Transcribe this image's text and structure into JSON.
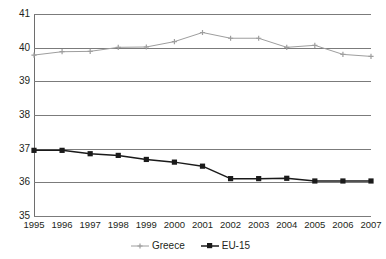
{
  "chart_data": {
    "type": "line",
    "title": "",
    "subtitle": "",
    "xlabel": "",
    "ylabel": "",
    "categories": [
      "1995",
      "1996",
      "1997",
      "1998",
      "1999",
      "2000",
      "2001",
      "2002",
      "2003",
      "2004",
      "2005",
      "2006",
      "2007"
    ],
    "x": [
      1995,
      1996,
      1997,
      1998,
      1999,
      2000,
      2001,
      2002,
      2003,
      2004,
      2005,
      2006,
      2007
    ],
    "ylim": [
      35,
      41
    ],
    "yticks": [
      41,
      40,
      39,
      38,
      37,
      36,
      35
    ],
    "ytick_labels": [
      "41",
      "40",
      "39",
      "38",
      "37",
      "36",
      "35"
    ],
    "grid": true,
    "legend_position": "bottom",
    "series": [
      {
        "name": "Greece",
        "color": "#9e9e9e",
        "marker": "small-cross",
        "values": [
          39.78,
          39.88,
          39.89,
          40.01,
          40.02,
          40.18,
          40.45,
          40.28,
          40.28,
          40.01,
          40.07,
          39.8,
          39.74
        ]
      },
      {
        "name": "EU-15",
        "color": "#1a1a1a",
        "marker": "square",
        "values": [
          36.95,
          36.95,
          36.85,
          36.8,
          36.68,
          36.6,
          36.48,
          36.11,
          36.11,
          36.12,
          36.04,
          36.04,
          36.04
        ]
      }
    ],
    "axis_color": "#6e6e6e",
    "grid_color": "#7b7b7b",
    "text_color": "#231f20",
    "background": "#ffffff"
  },
  "legend": {
    "items": [
      {
        "label": "Greece",
        "color": "#9e9e9e"
      },
      {
        "label": "EU-15",
        "color": "#1a1a1a"
      }
    ]
  }
}
